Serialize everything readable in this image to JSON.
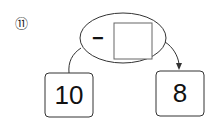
{
  "problem": {
    "number_label": "⑪",
    "operator": "−",
    "answer_blank": "",
    "start_value": "10",
    "result_value": "8"
  },
  "colors": {
    "stroke": "#333333",
    "blank_stroke": "#555555",
    "text": "#111111"
  }
}
